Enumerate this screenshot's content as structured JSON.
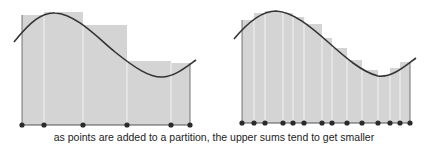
{
  "caption": "as points are added to a partition, the upper sums tend to get smaller",
  "colors": {
    "rect_fill": "#d4d4d4",
    "rect_divider": "#f2f2f2",
    "curve": "#333333",
    "point": "#2a2a2a",
    "axis": "#555555"
  },
  "panels": [
    {
      "name": "coarse-partition",
      "baseline_y": 125,
      "points_x": [
        22,
        44,
        83,
        127,
        171,
        190
      ],
      "rect_tops": [
        15,
        12,
        25,
        61,
        63
      ],
      "curve_path": "M14,42 C30,22 42,12 55,13 C75,14 95,35 115,52 C135,68 150,78 163,77 C175,76 185,68 196,60"
    },
    {
      "name": "refined-partition",
      "baseline_y": 123,
      "points_x": [
        242,
        254,
        265,
        283,
        293,
        304,
        322,
        332,
        347,
        362,
        378,
        390,
        400,
        410
      ],
      "rect_tops": [
        20,
        13,
        11,
        13,
        17,
        24,
        38,
        48,
        60,
        70,
        75,
        68,
        62
      ],
      "curve_path": "M234,39 C248,22 262,11 276,11 C293,12 310,26 328,42 C346,58 362,72 378,76 C392,78 405,66 416,58"
    }
  ]
}
